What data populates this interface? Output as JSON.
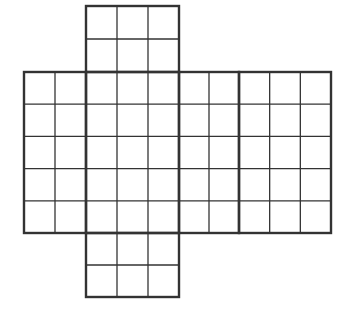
{
  "diagram": {
    "type": "cube-net-grid",
    "colors": {
      "line": "#333333",
      "background": "#ffffff"
    },
    "faces": [
      {
        "name": "top-face",
        "cols": 3,
        "rows": 2,
        "x": 86,
        "y": 6,
        "w": 93,
        "h": 66
      },
      {
        "name": "left-face",
        "cols": 2,
        "rows": 5,
        "x": 24,
        "y": 72,
        "w": 62,
        "h": 161
      },
      {
        "name": "front-face",
        "cols": 3,
        "rows": 5,
        "x": 86,
        "y": 72,
        "w": 93,
        "h": 161
      },
      {
        "name": "right-face",
        "cols": 2,
        "rows": 5,
        "x": 179,
        "y": 72,
        "w": 60,
        "h": 161
      },
      {
        "name": "back-face",
        "cols": 3,
        "rows": 5,
        "x": 239,
        "y": 72,
        "w": 92,
        "h": 161
      },
      {
        "name": "bottom-face",
        "cols": 3,
        "rows": 2,
        "x": 86,
        "y": 233,
        "w": 93,
        "h": 64
      }
    ]
  }
}
